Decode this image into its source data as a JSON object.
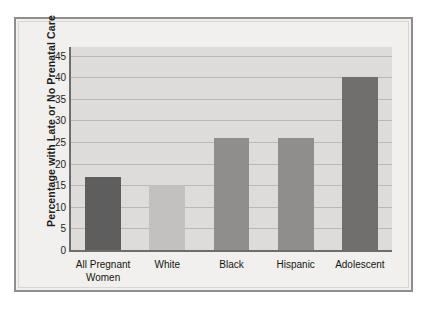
{
  "chart_data": {
    "type": "bar",
    "title": "",
    "xlabel": "",
    "ylabel": "Percentage with Late or No Prenatal Care",
    "categories": [
      "All Pregnant\nWomen",
      "White",
      "Black",
      "Hispanic",
      "Adolescent"
    ],
    "values": [
      17,
      15,
      26,
      26,
      40
    ],
    "ylim": [
      0,
      47
    ],
    "yticks": [
      0,
      5,
      10,
      15,
      20,
      25,
      30,
      35,
      40,
      45
    ],
    "ytick_labels": [
      "0",
      "5",
      "10",
      "15",
      "20",
      "25",
      "30",
      "35",
      "40",
      "45"
    ],
    "grid": true,
    "legend": "none",
    "bar_colors": [
      "#5e5e5e",
      "#c2c1bf",
      "#8f8e8c",
      "#8f8e8c",
      "#706f6d"
    ],
    "plot_background": "#dddcda",
    "figure_background": "#f1f0ee",
    "axis_color": "#6e6d6b",
    "gridline_color": "#b9b8b5"
  }
}
